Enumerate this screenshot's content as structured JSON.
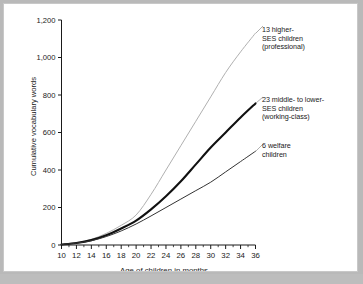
{
  "chart_data": {
    "type": "line",
    "title": "",
    "xlabel": "Age of children in months",
    "ylabel": "Cumulative vocabulary words",
    "xlim": [
      10,
      36
    ],
    "ylim": [
      0,
      1200
    ],
    "grid": false,
    "legend_position": "inline-right-annotations",
    "x_ticks": [
      10,
      12,
      14,
      16,
      18,
      20,
      22,
      24,
      26,
      28,
      30,
      32,
      34,
      36
    ],
    "x_tick_labels": [
      "10",
      "12",
      "14",
      "16",
      "18",
      "20",
      "22",
      "24",
      "26",
      "28",
      "30",
      "32",
      "34",
      "36"
    ],
    "x_minor_ticks": [
      11,
      13,
      15,
      17,
      19,
      21,
      23,
      25,
      27,
      29,
      31,
      33,
      35
    ],
    "y_ticks": [
      0,
      200,
      400,
      600,
      800,
      1000,
      1200
    ],
    "y_tick_labels": [
      "0",
      "200",
      "400",
      "600",
      "800",
      "1,000",
      "1,200"
    ],
    "x": [
      10,
      12,
      14,
      16,
      18,
      20,
      22,
      24,
      26,
      28,
      30,
      32,
      34,
      36
    ],
    "series": [
      {
        "name": "13 higher-SES children (professional)",
        "label_lines": [
          "13 higher-",
          "SES children",
          "(professional)"
        ],
        "color": "#b0b0b0",
        "width": 1.0,
        "values": [
          3,
          12,
          30,
          62,
          105,
          160,
          270,
          400,
          530,
          660,
          790,
          920,
          1030,
          1130
        ]
      },
      {
        "name": "23 middle- to lower-SES children (working-class)",
        "label_lines": [
          "23 middle- to lower-",
          "SES children",
          "(working-class)"
        ],
        "color": "#111111",
        "width": 2.1,
        "values": [
          3,
          11,
          26,
          52,
          88,
          130,
          190,
          260,
          340,
          430,
          520,
          600,
          680,
          755
        ]
      },
      {
        "name": "6 welfare children",
        "label_lines": [
          "6 welfare",
          "children"
        ],
        "color": "#333333",
        "width": 1.0,
        "values": [
          3,
          10,
          23,
          45,
          75,
          112,
          155,
          200,
          245,
          290,
          335,
          390,
          445,
          500
        ]
      }
    ]
  },
  "annotations": {
    "higher_ses": "13 higher-\nSES children\n(professional)",
    "middle_lower_ses": "23 middle- to lower-\nSES children\n(working-class)",
    "welfare": "6 welfare\nchildren"
  },
  "axes": {
    "x_title": "Age of children in months",
    "y_title": "Cumulative vocabulary words"
  }
}
